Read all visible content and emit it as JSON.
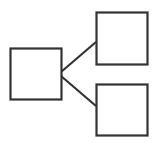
{
  "diagram": {
    "stroke_color": "#333333",
    "background": "#ffffff",
    "nodes": [
      {
        "id": "root",
        "x": 10.5,
        "y": 48.5,
        "w": 51,
        "h": 51,
        "label": ""
      },
      {
        "id": "child-top",
        "x": 96.5,
        "y": 12.5,
        "w": 51,
        "h": 52,
        "label": ""
      },
      {
        "id": "child-bottom",
        "x": 96.5,
        "y": 84.5,
        "w": 51,
        "h": 51,
        "label": ""
      }
    ],
    "edges": [
      {
        "from": "root",
        "to": "child-top",
        "x1": 61,
        "y1": 72,
        "x2": 96,
        "y2": 42
      },
      {
        "from": "root",
        "to": "child-bottom",
        "x1": 61,
        "y1": 76,
        "x2": 96,
        "y2": 106
      }
    ]
  }
}
